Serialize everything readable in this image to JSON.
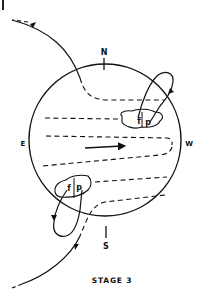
{
  "diagram": {
    "caption": "STAGE 3",
    "directions": {
      "north": "N",
      "south": "S",
      "east": "E",
      "west": "W"
    },
    "northern_region": {
      "leading": "f",
      "preceding": "p"
    },
    "southern_region": {
      "leading": "f",
      "preceding": "p"
    },
    "colors": {
      "ink": "#111111",
      "background": "#ffffff"
    }
  }
}
